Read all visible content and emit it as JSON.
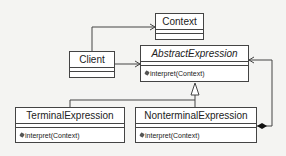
{
  "diagram": {
    "type": "UML class diagram (Interpreter pattern)",
    "classes": {
      "context": {
        "name": "Context",
        "operations": []
      },
      "client": {
        "name": "Client",
        "operations": []
      },
      "abstract_expression": {
        "name": "AbstractExpression",
        "abstract": true,
        "operations": [
          "interpret(Context)"
        ]
      },
      "terminal_expression": {
        "name": "TerminalExpression",
        "operations": [
          "interpret(Context)"
        ]
      },
      "nonterminal_expression": {
        "name": "NonterminalExpression",
        "operations": [
          "interpret(Context)"
        ]
      }
    },
    "relationships": [
      {
        "from": "Client",
        "to": "Context",
        "type": "association"
      },
      {
        "from": "Client",
        "to": "AbstractExpression",
        "type": "association"
      },
      {
        "from": "TerminalExpression",
        "to": "AbstractExpression",
        "type": "generalization"
      },
      {
        "from": "NonterminalExpression",
        "to": "AbstractExpression",
        "type": "generalization"
      },
      {
        "from": "NonterminalExpression",
        "to": "AbstractExpression",
        "type": "composition"
      }
    ]
  }
}
